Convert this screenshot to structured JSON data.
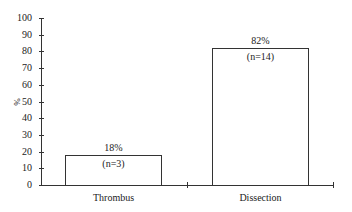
{
  "chart_data": {
    "type": "bar",
    "title": "",
    "xlabel": "",
    "ylabel": "%",
    "ylim": [
      0,
      100
    ],
    "yticks": [
      0,
      10,
      20,
      30,
      40,
      50,
      60,
      70,
      80,
      90,
      100
    ],
    "categories": [
      "Thrombus",
      "Dissection"
    ],
    "values": [
      18,
      82
    ],
    "value_labels": [
      "18%",
      "82%"
    ],
    "n_labels": [
      "(n=3)",
      "(n=14)"
    ],
    "grid": false,
    "legend": null
  },
  "yticks_labels": [
    "0",
    "10",
    "20",
    "30",
    "40",
    "50",
    "60",
    "70",
    "80",
    "90",
    "100"
  ]
}
